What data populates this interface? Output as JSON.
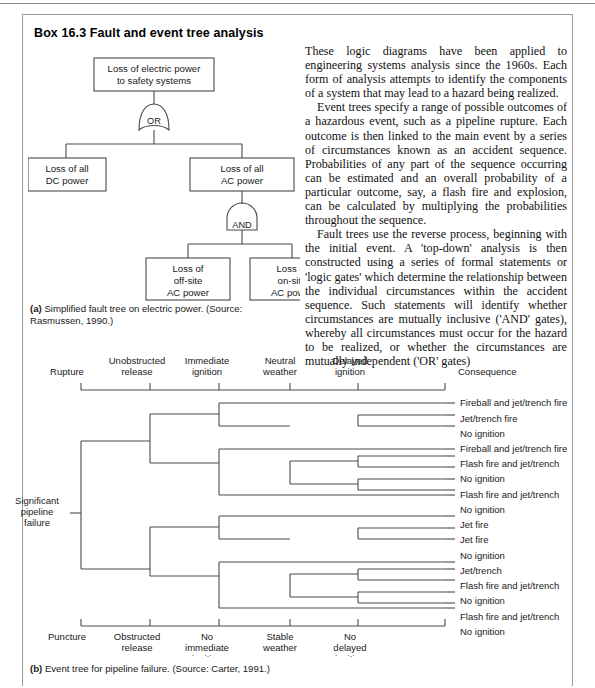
{
  "box": {
    "title": "Box 16.3  Fault and event tree analysis"
  },
  "prose": {
    "paragraphs": [
      "These logic diagrams have been applied to engineering systems analysis since the 1960s. Each form of analysis attempts to identify the components of a system that may lead to a hazard being realized.",
      "Event trees specify a range of possible outcomes of a hazardous event, such as a pipeline rupture. Each outcome is then linked to the main event by a series of circumstances known as an accident sequence. Probabilities of any part of the sequence occurring can be estimated and an overall probability of a particular outcome, say, a flash fire and explosion, can be calculated by multiplying the probabilities throughout the sequence.",
      "Fault trees use the reverse process, beginning with the initial event. A 'top-down' analysis is then constructed using a series of formal statements or 'logic gates' which determine the relationship between the individual circumstances within the accident sequence. Such statements will identify whether circumstances are mutually inclusive ('AND' gates), whereby all circumstances must occur for the hazard to be realized, or whether the circumstances are mutually independent ('OR' gates)"
    ]
  },
  "fault_tree": {
    "top_event": [
      "Loss of electric power",
      "to safety systems"
    ],
    "gate_or": "OR",
    "gate_and": "AND",
    "node_dc": [
      "Loss of all",
      "DC power"
    ],
    "node_ac": [
      "Loss of all",
      "AC power"
    ],
    "node_offsite": [
      "Loss of",
      "off-site",
      "AC power"
    ],
    "node_onsite": [
      "Loss of",
      "on-site",
      "AC power"
    ],
    "caption_marker": "(a)",
    "caption_text": "Simplified fault tree on electric power. (Source: Rasmussen, 1990.)"
  },
  "event_tree": {
    "top_headings": [
      {
        "lines": [
          "Rupture"
        ]
      },
      {
        "lines": [
          "Unobstructed",
          "release"
        ]
      },
      {
        "lines": [
          "Immediate",
          "ignition"
        ]
      },
      {
        "lines": [
          "Neutral",
          "weather"
        ]
      },
      {
        "lines": [
          "Delayed",
          "ignition"
        ]
      },
      {
        "lines": [
          "Consequence"
        ]
      }
    ],
    "bottom_headings": [
      {
        "lines": [
          "Puncture"
        ]
      },
      {
        "lines": [
          "Obstructed",
          "release"
        ]
      },
      {
        "lines": [
          "No",
          "immediate",
          "ignition"
        ]
      },
      {
        "lines": [
          "Stable",
          "weather"
        ]
      },
      {
        "lines": [
          "No",
          "delayed",
          "ignition"
        ]
      }
    ],
    "root_label": [
      "Significant",
      "pipeline",
      "failure"
    ],
    "consequences": [
      "Fireball and jet/trench fire",
      "Jet/trench fire",
      "No ignition",
      "Fireball and jet/trench fire",
      "Flash fire and jet/trench",
      "No ignition",
      "Flash fire and jet/trench",
      "No ignition",
      "Jet fire",
      "Jet fire",
      "No ignition",
      "Jet/trench",
      "Flash fire and jet/trench",
      "No ignition",
      "Flash fire and jet/trench",
      "No ignition"
    ],
    "caption_marker": "(b)",
    "caption_text": "Event tree for pipeline failure. (Source: Carter, 1991.)"
  },
  "colors": {
    "line": "#4a4a4a",
    "text": "#1a1a1a",
    "frame": "#9a9a9a"
  }
}
